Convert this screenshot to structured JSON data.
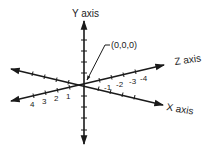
{
  "diagram": {
    "colors": {
      "line": "#1a1a1a",
      "text": "#222222",
      "background": "#ffffff"
    },
    "axes": {
      "y": {
        "label": "Y axis"
      },
      "z": {
        "label": "Z axis"
      },
      "x": {
        "label": "X axis"
      }
    },
    "origin": {
      "label": "(0,0,0)"
    },
    "tick_labels": {
      "positive": [
        "4",
        "3",
        "2",
        "1"
      ],
      "negative": [
        "-1",
        "-2",
        "-3",
        "-4"
      ]
    }
  }
}
